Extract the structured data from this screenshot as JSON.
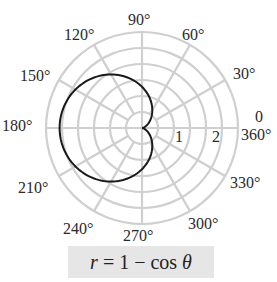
{
  "chart_data": {
    "type": "line",
    "subtype": "polar",
    "title": "r = 1 − cos θ",
    "equation": "r = 1 - cos(theta)",
    "angular_ticks": [
      "0",
      "30°",
      "60°",
      "90°",
      "120°",
      "150°",
      "180°",
      "210°",
      "240°",
      "270°",
      "300°",
      "330°",
      "360°"
    ],
    "radial_ticks": [
      "1",
      "2"
    ],
    "radial_range": [
      0,
      2.33
    ],
    "grid": true,
    "series": [
      {
        "name": "r = 1 − cos θ",
        "theta_deg": [
          0,
          30,
          60,
          90,
          120,
          150,
          180,
          210,
          240,
          270,
          300,
          330,
          360
        ],
        "r": [
          0,
          0.134,
          0.5,
          1,
          1.5,
          1.866,
          2,
          1.866,
          1.5,
          1,
          0.5,
          0.134,
          0
        ]
      }
    ],
    "colors": {
      "grid": "#cfcfcf",
      "curve": "#1a1a1a",
      "caption_bg": "#e6e6e6"
    }
  },
  "labels": {
    "a0": "0",
    "a30": "30°",
    "a60": "60°",
    "a90": "90°",
    "a120": "120°",
    "a150": "150°",
    "a180": "180°",
    "a210": "210°",
    "a240": "240°",
    "a270": "270°",
    "a300": "300°",
    "a330": "330°",
    "a360": "360°",
    "r1": "1",
    "r2": "2"
  },
  "caption": {
    "r": "r",
    "rest": " = 1 − cos ",
    "theta": "θ"
  }
}
